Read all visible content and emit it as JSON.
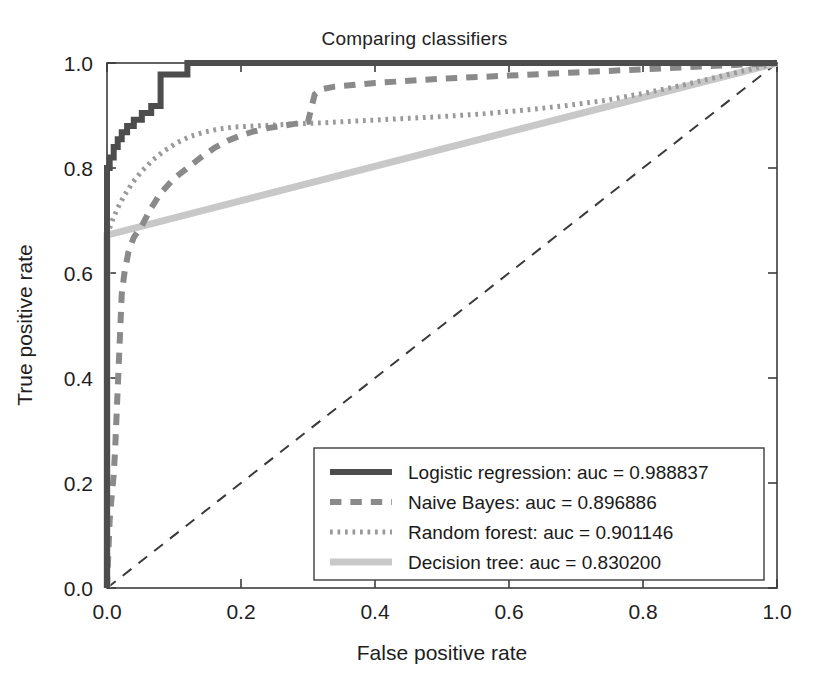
{
  "chart_data": {
    "type": "line",
    "title": "Comparing classifiers",
    "xlabel": "False positive rate",
    "ylabel": "True positive rate",
    "xlim": [
      0.0,
      1.0
    ],
    "ylim": [
      0.0,
      1.0
    ],
    "xticks": [
      "0.0",
      "0.2",
      "0.4",
      "0.6",
      "0.8",
      "1.0"
    ],
    "xtick_values": [
      0.0,
      0.2,
      0.4,
      0.6,
      0.8,
      1.0
    ],
    "yticks": [
      "0.0",
      "0.2",
      "0.4",
      "0.6",
      "0.8",
      "1.0"
    ],
    "ytick_values": [
      0.0,
      0.2,
      0.4,
      0.6,
      0.8,
      1.0
    ],
    "grid": false,
    "legend_position": "lower right",
    "reference_line": {
      "name": "chance-diagonal",
      "x": [
        0.0,
        1.0
      ],
      "y": [
        0.0,
        1.0
      ],
      "style": "dashed",
      "color": "#3a3a3a"
    },
    "series": [
      {
        "name": "Logistic regression",
        "auc": 0.988837,
        "legend_label": "Logistic regression: auc = 0.988837",
        "color": "#4d4d4d",
        "style": "solid",
        "width": 6,
        "x": [
          0.0,
          0.0,
          0.004,
          0.004,
          0.01,
          0.01,
          0.016,
          0.016,
          0.022,
          0.022,
          0.03,
          0.03,
          0.04,
          0.04,
          0.052,
          0.052,
          0.066,
          0.066,
          0.08,
          0.08,
          0.12,
          0.12,
          1.0
        ],
        "y": [
          0.0,
          0.8,
          0.8,
          0.82,
          0.82,
          0.84,
          0.84,
          0.855,
          0.855,
          0.868,
          0.868,
          0.88,
          0.88,
          0.892,
          0.892,
          0.905,
          0.905,
          0.918,
          0.918,
          0.978,
          0.978,
          1.0,
          1.0
        ]
      },
      {
        "name": "Naive Bayes",
        "auc": 0.896886,
        "legend_label": "Naive Bayes: auc = 0.896886",
        "color": "#8a8a8a",
        "style": "dashed",
        "width": 6,
        "x": [
          0.0,
          0.004,
          0.006,
          0.008,
          0.01,
          0.012,
          0.014,
          0.016,
          0.018,
          0.02,
          0.022,
          0.026,
          0.032,
          0.04,
          0.052,
          0.065,
          0.08,
          0.1,
          0.12,
          0.14,
          0.16,
          0.18,
          0.2,
          0.22,
          0.24,
          0.26,
          0.28,
          0.3,
          0.31,
          0.32,
          0.34,
          0.4,
          0.5,
          0.6,
          0.7,
          0.8,
          0.9,
          1.0
        ],
        "y": [
          0.0,
          0.13,
          0.16,
          0.19,
          0.215,
          0.26,
          0.32,
          0.38,
          0.44,
          0.5,
          0.56,
          0.6,
          0.64,
          0.668,
          0.69,
          0.722,
          0.752,
          0.78,
          0.8,
          0.82,
          0.838,
          0.852,
          0.862,
          0.87,
          0.876,
          0.88,
          0.884,
          0.888,
          0.94,
          0.95,
          0.955,
          0.962,
          0.97,
          0.976,
          0.982,
          0.988,
          0.994,
          1.0
        ]
      },
      {
        "name": "Random forest",
        "auc": 0.901146,
        "legend_label": "Random forest: auc = 0.901146",
        "color": "#9a9a9a",
        "style": "dotted",
        "width": 5,
        "x": [
          0.0,
          0.008,
          0.016,
          0.026,
          0.038,
          0.052,
          0.068,
          0.086,
          0.104,
          0.124,
          0.144,
          0.165,
          0.19,
          0.22,
          0.25,
          0.28,
          0.32,
          0.38,
          0.44,
          0.5,
          0.56,
          0.62,
          0.68,
          0.74,
          0.8,
          0.86,
          0.92,
          0.96,
          1.0
        ],
        "y": [
          0.672,
          0.7,
          0.724,
          0.748,
          0.772,
          0.794,
          0.815,
          0.833,
          0.848,
          0.86,
          0.868,
          0.874,
          0.878,
          0.88,
          0.882,
          0.884,
          0.886,
          0.89,
          0.894,
          0.898,
          0.903,
          0.91,
          0.918,
          0.928,
          0.942,
          0.958,
          0.976,
          0.988,
          1.0
        ]
      },
      {
        "name": "Decision tree",
        "auc": 0.8302,
        "legend_label": "Decision tree: auc = 0.830200",
        "color": "#c8c8c8",
        "style": "solid",
        "width": 7,
        "x": [
          0.0,
          0.0,
          1.0
        ],
        "y": [
          0.0,
          0.672,
          1.0
        ]
      }
    ]
  },
  "legend": {
    "entries": [
      {
        "label": "Logistic regression: auc = 0.988837",
        "swatch": "logistic-regression-swatch"
      },
      {
        "label": "Naive Bayes: auc = 0.896886",
        "swatch": "naive-bayes-swatch"
      },
      {
        "label": "Random forest: auc = 0.901146",
        "swatch": "random-forest-swatch"
      },
      {
        "label": "Decision tree: auc = 0.830200",
        "swatch": "decision-tree-swatch"
      }
    ]
  }
}
